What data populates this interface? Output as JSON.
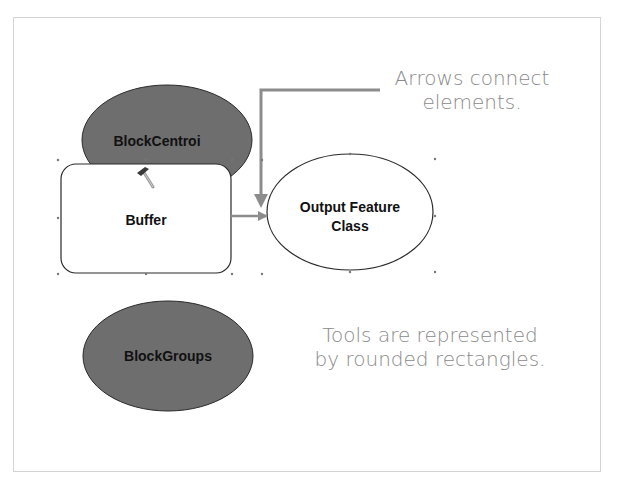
{
  "slide": {
    "nodes": {
      "block_centroi": {
        "label": "BlockCentroi",
        "type": "input-data",
        "fill": "#6e6e6e"
      },
      "buffer": {
        "label": "Buffer",
        "type": "tool",
        "fill": "#ffffff"
      },
      "output_feature_class": {
        "label_line1": "Output Feature",
        "label_line2": "Class",
        "type": "output-data",
        "fill": "#ffffff"
      },
      "block_groups": {
        "label": "BlockGroups",
        "type": "input-data",
        "fill": "#6e6e6e"
      }
    },
    "callouts": {
      "arrows": {
        "line1": "Arrows connect",
        "line2": "elements."
      },
      "tools": {
        "line1": "Tools are represented",
        "line2": "by rounded rectangles."
      }
    },
    "colors": {
      "callout_text": "#8a8a8a",
      "connector": "#8c8c8c",
      "data_fill": "#6e6e6e"
    },
    "icons": {
      "tool_icon": "hammer-icon"
    }
  }
}
